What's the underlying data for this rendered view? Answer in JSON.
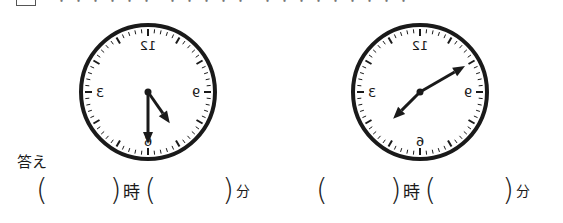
{
  "header": {
    "question_number": "",
    "instruction_cutoff": "・・・・・・ ・・・・・ ・・・・・・・・・"
  },
  "clocks": [
    {
      "id": "clock-1",
      "mirrored": true,
      "numerals": {
        "top": "12",
        "right": "9",
        "bottom": "6",
        "left": "3"
      },
      "minute_hand_angle_deg": 180,
      "hour_hand_angle_deg": 145,
      "reading_note": "mirrored face; minute hand at 6, hour hand between 4 and 5"
    },
    {
      "id": "clock-2",
      "mirrored": true,
      "numerals": {
        "top": "12",
        "right": "9",
        "bottom": "6",
        "left": "3"
      },
      "minute_hand_angle_deg": 60,
      "hour_hand_angle_deg": 225,
      "reading_note": "mirrored face; long hand toward upper right, short hand toward lower left"
    }
  ],
  "answer": {
    "label": "答え",
    "rows": [
      {
        "open": "(",
        "close": ")",
        "hour_unit": "時",
        "minute_unit": "分",
        "hour_value": "",
        "minute_value": ""
      },
      {
        "open": "(",
        "close": ")",
        "hour_unit": "時",
        "minute_unit": "分",
        "hour_value": "",
        "minute_value": ""
      }
    ]
  },
  "colors": {
    "ink": "#1a1a1a",
    "background": "#ffffff"
  }
}
